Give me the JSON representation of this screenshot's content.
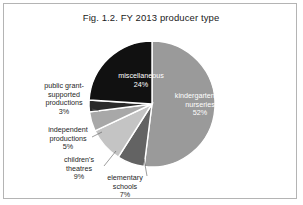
{
  "figure": {
    "title": "Fig. 1.2. FY 2013 producer type",
    "frame_color": "#b4b4b4",
    "background": "#ffffff"
  },
  "chart_data": {
    "type": "pie",
    "title": "Fig. 1.2. FY 2013 producer type",
    "xlabel": "",
    "ylabel": "",
    "units": "percent",
    "start_angle_deg": 0,
    "direction": "clockwise",
    "legend": "none",
    "grid": false,
    "categories": [
      "kindergartens & nurseries",
      "elementary schools",
      "children's theatres",
      "independent productions",
      "public grant-supported productions",
      "miscellaneous"
    ],
    "values": [
      52,
      7,
      9,
      5,
      3,
      24
    ],
    "labels": [
      "kindergartens &\nnurseries\n52%",
      "elementary\nschools\n7%",
      "children's\ntheatres\n9%",
      "independent\nproductions\n5%",
      "public grant-\nsupported\nproductions\n3%",
      "miscellaneous\n24%"
    ],
    "colors": [
      "#9a9a9a",
      "#636363",
      "#c4c4c4",
      "#a8a8a8",
      "#2b2b2b",
      "#111111"
    ],
    "label_placement": [
      "inside",
      "outside",
      "outside",
      "outside",
      "outside",
      "inside"
    ],
    "slice_border_color": "#ffffff"
  },
  "slices": [
    {
      "name": "kindergartens-nurseries",
      "label": "kindergartens &\nnurseries\n52%",
      "percent": 52,
      "color": "#9a9a9a"
    },
    {
      "name": "elementary-schools",
      "label": "elementary\nschools\n7%",
      "percent": 7,
      "color": "#636363"
    },
    {
      "name": "childrens-theatres",
      "label": "children's\ntheatres\n9%",
      "percent": 9,
      "color": "#c4c4c4"
    },
    {
      "name": "independent-productions",
      "label": "independent\nproductions\n5%",
      "percent": 5,
      "color": "#a8a8a8"
    },
    {
      "name": "public-grant-supported-productions",
      "label": "public grant-\nsupported\nproductions\n3%",
      "percent": 3,
      "color": "#2b2b2b"
    },
    {
      "name": "miscellaneous",
      "label": "miscellaneous\n24%",
      "percent": 24,
      "color": "#111111"
    }
  ]
}
